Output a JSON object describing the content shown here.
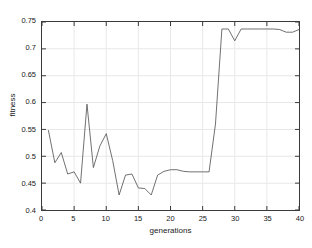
{
  "chart_data": {
    "type": "line",
    "title": "",
    "subtitle": "",
    "xlabel": "generations",
    "ylabel": "fitness",
    "xlim": [
      0,
      40
    ],
    "ylim": [
      0.4,
      0.75
    ],
    "xticks": [
      0,
      5,
      10,
      15,
      20,
      25,
      30,
      35,
      40
    ],
    "xtick_labels": [
      "0",
      "5",
      "10",
      "15",
      "20",
      "25",
      "30",
      "35",
      "40"
    ],
    "yticks": [
      0.4,
      0.45,
      0.5,
      0.55,
      0.6,
      0.65,
      0.7,
      0.75
    ],
    "ytick_labels": [
      "0.4",
      "0.45",
      "0.5",
      "0.55",
      "0.6",
      "0.65",
      "0.7",
      "0.75"
    ],
    "grid": true,
    "legend": null,
    "legend_position": "none",
    "line_color": "#4d4d4d",
    "line_width": 0.8,
    "axis_color": "#3a3a3a",
    "grid_color": "#e8e8e8",
    "background_color": "#ffffff",
    "series": [
      {
        "name": "fitness",
        "x": [
          1,
          2,
          3,
          4,
          5,
          6,
          7,
          8,
          9,
          10,
          11,
          12,
          13,
          14,
          15,
          16,
          17,
          18,
          19,
          20,
          21,
          22,
          23,
          24,
          25,
          26,
          27,
          28,
          29,
          30,
          31,
          32,
          33,
          34,
          35,
          36,
          37,
          38,
          39,
          40
        ],
        "values": [
          0.548,
          0.488,
          0.507,
          0.467,
          0.471,
          0.45,
          0.597,
          0.479,
          0.519,
          0.542,
          0.492,
          0.428,
          0.465,
          0.467,
          0.441,
          0.44,
          0.428,
          0.465,
          0.472,
          0.475,
          0.475,
          0.472,
          0.471,
          0.471,
          0.471,
          0.471,
          0.56,
          0.737,
          0.737,
          0.715,
          0.737,
          0.737,
          0.737,
          0.737,
          0.737,
          0.737,
          0.736,
          0.731,
          0.731,
          0.736
        ]
      }
    ]
  }
}
